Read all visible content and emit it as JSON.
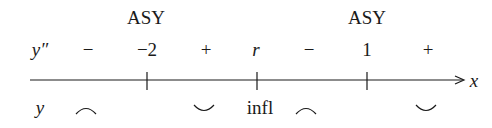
{
  "diagram": {
    "type": "sign-chart",
    "top_labels": [
      {
        "text": "ASY",
        "x": 146
      },
      {
        "text": "ASY",
        "x": 367
      }
    ],
    "sign_row": {
      "label": "y″",
      "entries": [
        {
          "text": "−",
          "x": 88
        },
        {
          "text": "−2",
          "x": 147
        },
        {
          "text": "+",
          "x": 206
        },
        {
          "text": "r",
          "x": 256,
          "italic": true
        },
        {
          "text": "−",
          "x": 309
        },
        {
          "text": "1",
          "x": 367
        },
        {
          "text": "+",
          "x": 428
        }
      ]
    },
    "axis": {
      "label": "x",
      "ticks_x": [
        147,
        257,
        367
      ]
    },
    "concavity_row": {
      "label": "y",
      "entries": [
        {
          "shape": "concave-down",
          "x": 86
        },
        {
          "shape": "concave-up",
          "x": 204
        },
        {
          "text": "infl",
          "x": 260
        },
        {
          "shape": "concave-down",
          "x": 306
        },
        {
          "shape": "concave-up",
          "x": 426
        }
      ]
    }
  }
}
